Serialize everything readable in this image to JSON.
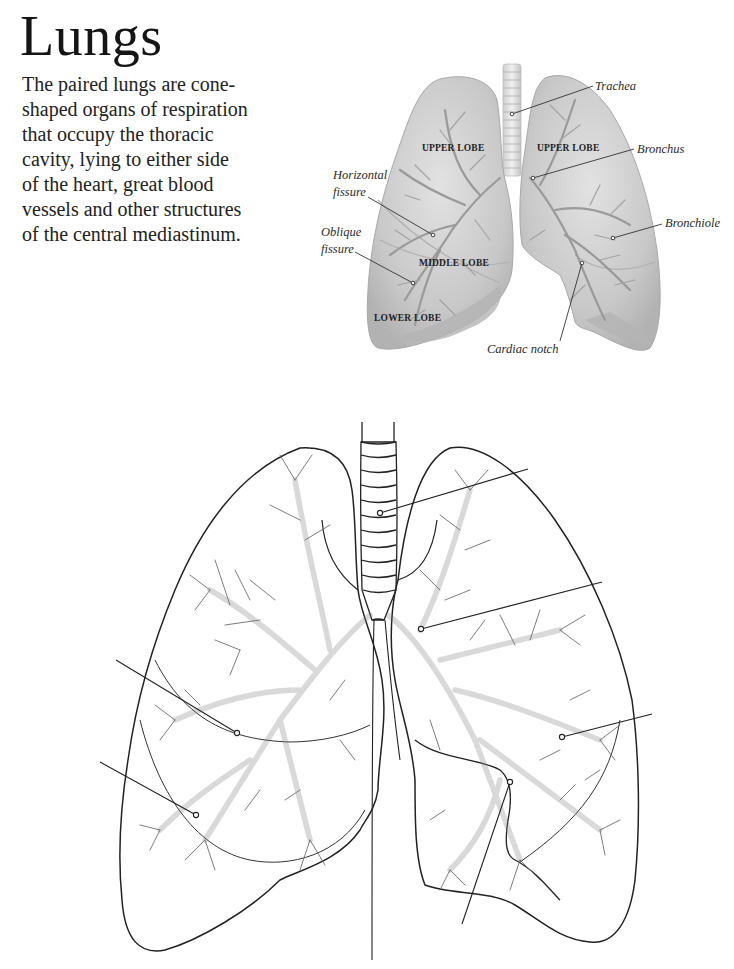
{
  "page": {
    "title": "Lungs",
    "intro_lines": [
      "The paired lungs are cone-",
      "shaped organs of respiration",
      "that occupy the thoracic",
      "cavity, lying to either side",
      "of the heart, great blood",
      "vessels and other structures",
      "of the central mediastinum."
    ]
  },
  "illustration": {
    "labels": {
      "trachea": "Trachea",
      "bronchus": "Bronchus",
      "bronchiole": "Bronchiole",
      "horizontal_fissure_1": "Horizontal",
      "horizontal_fissure_2": "fissure",
      "oblique_fissure_1": "Oblique",
      "oblique_fissure_2": "fissure",
      "cardiac_notch": "Cardiac notch"
    },
    "lobes": {
      "left_upper": "UPPER LOBE",
      "right_upper": "UPPER LOBE",
      "middle": "MIDDLE LOBE",
      "lower": "LOWER LOBE"
    },
    "colors": {
      "lung_fill": "#c9c9c9",
      "lung_shadow": "#a9a9a9",
      "branch": "#8f8f8f",
      "leader": "#333333"
    }
  },
  "worksheet": {
    "blank_label_count": 6,
    "outline_color": "#222222",
    "branch_color": "#777777"
  }
}
